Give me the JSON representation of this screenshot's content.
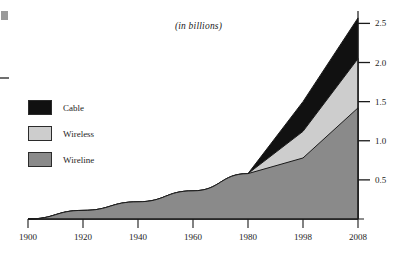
{
  "chart_data": {
    "type": "area",
    "stacked": true,
    "title": "(in billions)",
    "xlabel": "",
    "ylabel": "",
    "x": [
      1900,
      1920,
      1940,
      1960,
      1980,
      1998,
      2008
    ],
    "xtick_labels": [
      "1900",
      "1920",
      "1940",
      "1960",
      "1980",
      "1998",
      "2008"
    ],
    "ytick_labels": [
      "0.5",
      "1.0",
      "1.5",
      "2.0",
      "2.5"
    ],
    "ytick_values": [
      0.5,
      1.0,
      1.5,
      2.0,
      2.5
    ],
    "ylim": [
      0,
      2.62
    ],
    "xlim": [
      1900,
      2008
    ],
    "grid": false,
    "legend_position": "left-middle",
    "axis_position": "right",
    "series": [
      {
        "name": "Wireline",
        "color": "#8a8a8a",
        "values": [
          0.0,
          0.11,
          0.22,
          0.36,
          0.58,
          0.78,
          1.42
        ]
      },
      {
        "name": "Wireless",
        "color": "#cdcdcd",
        "values": [
          0.0,
          0.0,
          0.0,
          0.0,
          0.0,
          0.34,
          0.63
        ]
      },
      {
        "name": "Cable",
        "color": "#111111",
        "values": [
          0.0,
          0.0,
          0.0,
          0.0,
          0.0,
          0.38,
          0.52
        ]
      }
    ],
    "cumulative_tops": {
      "wireline": [
        0.0,
        0.11,
        0.22,
        0.36,
        0.58,
        0.78,
        1.42
      ],
      "wireless": [
        0.0,
        0.11,
        0.22,
        0.36,
        0.58,
        1.12,
        2.05
      ],
      "cable": [
        0.0,
        0.11,
        0.22,
        0.36,
        0.58,
        1.5,
        2.57
      ]
    }
  },
  "legend": {
    "items": [
      {
        "label": "Cable",
        "color": "#111111"
      },
      {
        "label": "Wireless",
        "color": "#cdcdcd"
      },
      {
        "label": "Wireline",
        "color": "#8a8a8a"
      }
    ]
  },
  "colors": {
    "cable": "#111111",
    "wireless": "#cdcdcd",
    "wireline": "#8a8a8a",
    "axis": "#1a1a1a",
    "background": "#ffffff"
  }
}
